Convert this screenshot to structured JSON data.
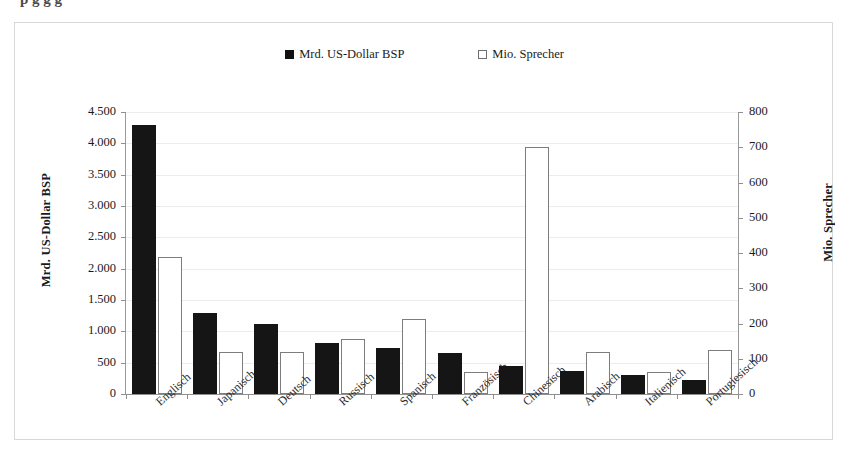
{
  "page": {
    "clipped_heading": "p g g g"
  },
  "chart_data": {
    "type": "bar",
    "title": "",
    "categories": [
      "Englisch",
      "Japanisch",
      "Deutsch",
      "Russisch",
      "Spanisch",
      "Französisch",
      "Chinesisch",
      "Arabisch",
      "Italienisch",
      "Portugiesisch"
    ],
    "series": [
      {
        "name": "Mrd. US-Dollar BSP",
        "axis": "left",
        "style": "filled",
        "values": [
          4300,
          1290,
          1110,
          810,
          740,
          660,
          450,
          360,
          300,
          230
        ]
      },
      {
        "name": "Mio. Sprecher",
        "axis": "right",
        "style": "hollow",
        "values": [
          388,
          120,
          120,
          155,
          212,
          62,
          700,
          120,
          62,
          125
        ]
      }
    ],
    "xlabel": "",
    "ylabel": "Mrd. US-Dollar BSP",
    "y2label": "Mio. Sprecher",
    "ylim": [
      0,
      4500
    ],
    "y2lim": [
      0,
      800
    ],
    "yticks": [
      "0",
      "500",
      "1.000",
      "1.500",
      "2.000",
      "2.500",
      "3.000",
      "3.500",
      "4.000",
      "4.500"
    ],
    "y2ticks": [
      "0",
      "100",
      "200",
      "300",
      "400",
      "500",
      "600",
      "700",
      "800"
    ],
    "grid": true,
    "legend_position": "top-center",
    "colors": {
      "series1": "#151515",
      "series2": "#ffffff",
      "series2_border": "#7d7d7d",
      "grid": "#ececec",
      "axis": "#8f8f8f"
    }
  },
  "legend": {
    "items": [
      {
        "label": "Mrd. US-Dollar BSP",
        "marker": "filled-square-icon"
      },
      {
        "label": "Mio. Sprecher",
        "marker": "hollow-square-icon"
      }
    ]
  }
}
